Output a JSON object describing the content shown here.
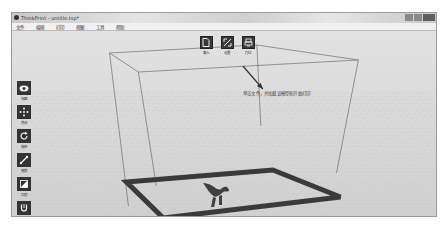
{
  "window": {
    "title": "ThinkPrint - untitle.tsp*",
    "controls": [
      "minimize",
      "maximize",
      "close"
    ]
  },
  "menubar": {
    "items": [
      {
        "label": "文件"
      },
      {
        "label": "编辑"
      },
      {
        "label": "打印"
      },
      {
        "label": "视图"
      },
      {
        "label": "工具"
      },
      {
        "label": "帮助"
      }
    ]
  },
  "top_toolbar": {
    "items": [
      {
        "label": "载入",
        "icon": "file-open-icon"
      },
      {
        "label": "设置",
        "icon": "settings-pen-icon"
      },
      {
        "label": "打印",
        "icon": "print-icon"
      }
    ]
  },
  "side_toolbar": {
    "items": [
      {
        "label": "视图",
        "icon": "eye-icon"
      },
      {
        "label": "移动",
        "icon": "move-icon"
      },
      {
        "label": "旋转",
        "icon": "rotate-icon"
      },
      {
        "label": "缩放",
        "icon": "scale-icon"
      },
      {
        "label": "切割",
        "icon": "cut-icon"
      },
      {
        "label": "镜像",
        "icon": "magnet-icon"
      }
    ]
  },
  "viewport": {
    "hint_text": "单击文件，并加载该模型和开始打印",
    "model": "dinosaur-model"
  },
  "colors": {
    "icon_bg": "#333333",
    "bed_border": "#3a3a3a",
    "viewport_bg": "#d9d9d9"
  }
}
